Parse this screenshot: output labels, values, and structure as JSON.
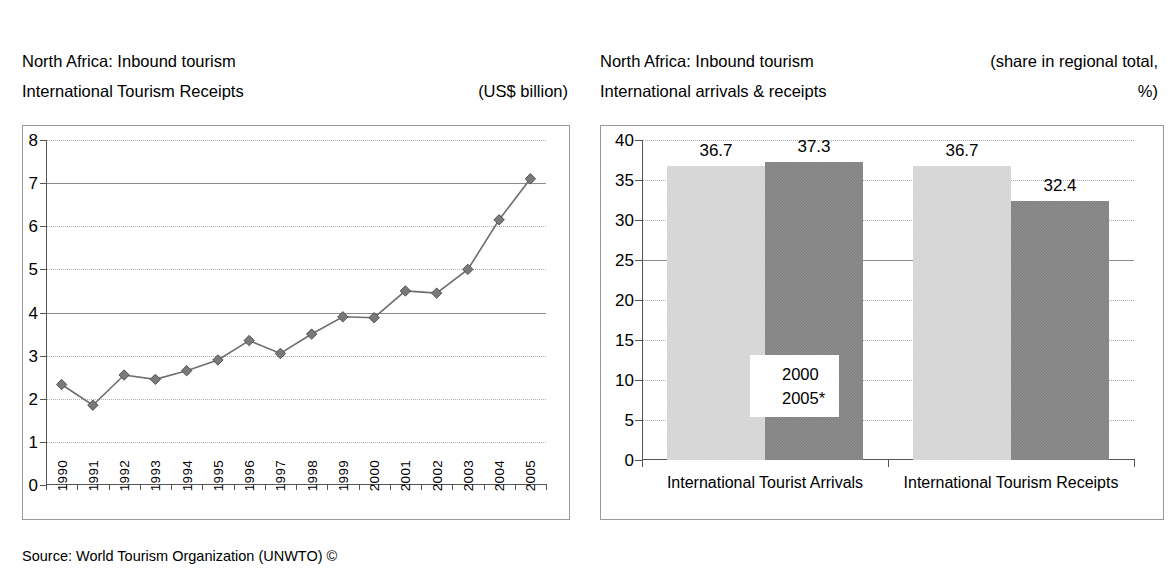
{
  "left_panel": {
    "title_line1": "North Africa: Inbound tourism",
    "title_line2": "International Tourism Receipts",
    "unit_note": "(US$ billion)",
    "source": "Source: World Tourism Organization (UNWTO) ©"
  },
  "right_panel": {
    "title_line1": "North Africa: Inbound tourism",
    "title_line2": "International arrivals & receipts",
    "unit_note_line1": "(share in regional total,",
    "unit_note_line2": "%)",
    "source": "Source: World Tourism Organization (UNWTO) ©"
  },
  "chart_data": [
    {
      "id": "international-tourism-receipts-line",
      "type": "line",
      "title": "North Africa: Inbound tourism — International Tourism Receipts",
      "xlabel": "",
      "ylabel": "",
      "unit": "US$ billion",
      "ylim": [
        0,
        8
      ],
      "yticks": [
        0,
        1,
        2,
        3,
        4,
        5,
        6,
        7,
        8
      ],
      "grid": "horizontal-dotted",
      "legend": "none",
      "marker": "diamond",
      "x": [
        "1990",
        "1991",
        "1992",
        "1993",
        "1994",
        "1995",
        "1996",
        "1997",
        "1998",
        "1999",
        "2000",
        "2001",
        "2002",
        "2003",
        "2004",
        "2005"
      ],
      "values": [
        2.33,
        1.85,
        2.55,
        2.45,
        2.65,
        2.9,
        3.35,
        3.05,
        3.5,
        3.9,
        3.88,
        4.5,
        4.45,
        5.0,
        6.15,
        7.1
      ],
      "source": "Source: World Tourism Organization (UNWTO) ©"
    },
    {
      "id": "arrivals-receipts-share-bar",
      "type": "bar",
      "title": "North Africa: Inbound tourism — International arrivals & receipts",
      "xlabel": "",
      "ylabel": "",
      "unit": "share in regional total, %",
      "ylim": [
        0,
        40
      ],
      "yticks": [
        0,
        5,
        10,
        15,
        20,
        25,
        30,
        35,
        40
      ],
      "grid": "horizontal-dotted",
      "legend_position": "inside-center-left",
      "categories": [
        "International Tourist Arrivals",
        "International Tourism Receipts"
      ],
      "series": [
        {
          "name": "2000",
          "values": [
            36.7,
            36.7
          ],
          "color": "#dcdcdc"
        },
        {
          "name": "2005*",
          "values": [
            37.3,
            32.4
          ],
          "color": "#8e8e8e"
        }
      ],
      "data_labels": [
        "36.7",
        "37.3",
        "36.7",
        "32.4"
      ],
      "source": "Source: World Tourism Organization (UNWTO) ©"
    }
  ]
}
